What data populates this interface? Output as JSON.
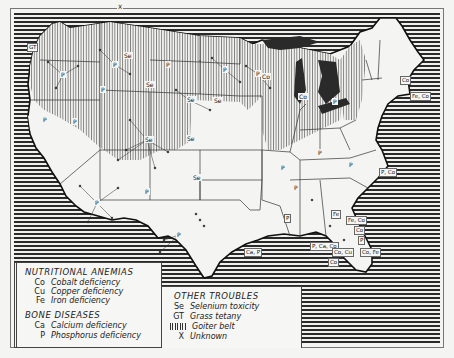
{
  "map": {
    "subject": "Nutritional deficiency areas of livestock in the United States",
    "colors": {
      "sea_stripe": "#2a2a2a",
      "land": "#f4f4f2",
      "goiter_hatch": "#555555",
      "ink": "#222222"
    },
    "region_labels": [
      {
        "code": "GT",
        "x": 33,
        "y": 47
      },
      {
        "code": "Co",
        "x": 406,
        "y": 80
      },
      {
        "code": "Fe, Co",
        "x": 416,
        "y": 96
      },
      {
        "code": "P, Co",
        "x": 385,
        "y": 172
      },
      {
        "code": "Fe, Co",
        "x": 352,
        "y": 220
      },
      {
        "code": "Co",
        "x": 360,
        "y": 230
      },
      {
        "code": "P",
        "x": 364,
        "y": 240
      },
      {
        "code": "P, Ca, Co",
        "x": 316,
        "y": 246
      },
      {
        "code": "Co, Cu",
        "x": 338,
        "y": 252
      },
      {
        "code": "Co, Fe",
        "x": 366,
        "y": 252
      },
      {
        "code": "Co",
        "x": 334,
        "y": 262
      },
      {
        "code": "Ca, P",
        "x": 250,
        "y": 252
      },
      {
        "code": "P",
        "x": 290,
        "y": 218
      },
      {
        "code": "Fe",
        "x": 337,
        "y": 214
      }
    ],
    "state_markers": [
      {
        "code": "P",
        "x": 63,
        "y": 75
      },
      {
        "code": "P",
        "x": 115,
        "y": 65
      },
      {
        "code": "Se",
        "x": 126,
        "y": 56
      },
      {
        "code": "P",
        "x": 168,
        "y": 65
      },
      {
        "code": "P",
        "x": 225,
        "y": 70
      },
      {
        "code": "P",
        "x": 258,
        "y": 74
      },
      {
        "code": "Se",
        "x": 148,
        "y": 85
      },
      {
        "code": "Se",
        "x": 189,
        "y": 100
      },
      {
        "code": "Se",
        "x": 216,
        "y": 101
      },
      {
        "code": "P",
        "x": 103,
        "y": 90
      },
      {
        "code": "Se",
        "x": 147,
        "y": 140
      },
      {
        "code": "Se",
        "x": 189,
        "y": 139
      },
      {
        "code": "P",
        "x": 45,
        "y": 120
      },
      {
        "code": "P",
        "x": 75,
        "y": 122
      },
      {
        "code": "P",
        "x": 97,
        "y": 203
      },
      {
        "code": "P",
        "x": 147,
        "y": 192
      },
      {
        "code": "Se",
        "x": 195,
        "y": 178
      },
      {
        "code": "Co",
        "x": 264,
        "y": 77
      },
      {
        "code": "Co",
        "x": 301,
        "y": 97
      },
      {
        "code": "P",
        "x": 320,
        "y": 153
      },
      {
        "code": "P",
        "x": 335,
        "y": 102
      },
      {
        "code": "P",
        "x": 283,
        "y": 168
      },
      {
        "code": "P",
        "x": 296,
        "y": 188
      },
      {
        "code": "P",
        "x": 351,
        "y": 165
      },
      {
        "code": "P",
        "x": 179,
        "y": 235
      },
      {
        "code": "X",
        "x": 120,
        "y": 7
      }
    ]
  },
  "legend": {
    "groups": [
      {
        "title": "NUTRITIONAL ANEMIAS",
        "items": [
          {
            "code": "Co",
            "label": "Cobalt deficiency"
          },
          {
            "code": "Cu",
            "label": "Copper deficiency"
          },
          {
            "code": "Fe",
            "label": "Iron deficiency"
          }
        ]
      },
      {
        "title": "BONE DISEASES",
        "items": [
          {
            "code": "Ca",
            "label": "Calcium deficiency"
          },
          {
            "code": "P",
            "label": "Phosphorus deficiency"
          }
        ]
      },
      {
        "title": "OTHER TROUBLES",
        "items": [
          {
            "code": "Se",
            "label": "Selenium toxicity"
          },
          {
            "code": "GT",
            "label": "Grass tetany"
          },
          {
            "code": "||||||",
            "label": "Goiter belt",
            "icon": "goiter-hatch"
          },
          {
            "code": "X",
            "label": "Unknown"
          }
        ]
      }
    ]
  }
}
